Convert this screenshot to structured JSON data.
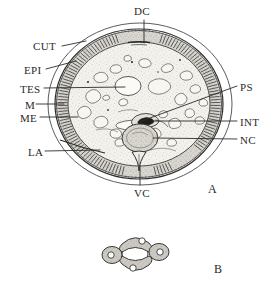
{
  "figure": {
    "panels": [
      {
        "id": "A",
        "x": 208,
        "y": 182,
        "caption": "A"
      },
      {
        "id": "B",
        "x": 214,
        "y": 262,
        "caption": "B"
      }
    ],
    "labels": [
      {
        "key": "DC",
        "text": "DC",
        "meaning": "dorsal chord",
        "x": 134,
        "y": 6,
        "side": "top"
      },
      {
        "key": "CUT",
        "text": "CUT",
        "meaning": "cuticle",
        "x": 33,
        "y": 41,
        "side": "left"
      },
      {
        "key": "EPI",
        "text": "EPI",
        "meaning": "epidermis",
        "x": 24,
        "y": 65,
        "side": "left"
      },
      {
        "key": "TES",
        "text": "TES",
        "meaning": "testis",
        "x": 20,
        "y": 84,
        "side": "left"
      },
      {
        "key": "M",
        "text": "M",
        "meaning": "muscle",
        "x": 25,
        "y": 100,
        "side": "left"
      },
      {
        "key": "ME",
        "text": "ME",
        "meaning": "muscle cell",
        "x": 20,
        "y": 113,
        "side": "left"
      },
      {
        "key": "LA",
        "text": "LA",
        "meaning": "lateral chord",
        "x": 28,
        "y": 147,
        "side": "left"
      },
      {
        "key": "PS",
        "text": "PS",
        "meaning": "pseudocoelom",
        "x": 240,
        "y": 82,
        "side": "right"
      },
      {
        "key": "INT",
        "text": "INT",
        "meaning": "intestine",
        "x": 240,
        "y": 117,
        "side": "right"
      },
      {
        "key": "NC",
        "text": "NC",
        "meaning": "nerve cord",
        "x": 240,
        "y": 135,
        "side": "right"
      },
      {
        "key": "VC",
        "text": "VC",
        "meaning": "ventral chord",
        "x": 134,
        "y": 188,
        "side": "bottom"
      }
    ],
    "colors": {
      "ink": "#2a2a2a",
      "outline": "#3a3a3a",
      "cytoplasm": "#efefe9",
      "hypodermis": "#d8d6cf",
      "muscle_band": "#cfcdc6",
      "intestine": "#c9c6bd",
      "nerve": "#b9b6ad",
      "lobe_fill": "#c6c4bc",
      "paper": "#ffffff"
    }
  }
}
